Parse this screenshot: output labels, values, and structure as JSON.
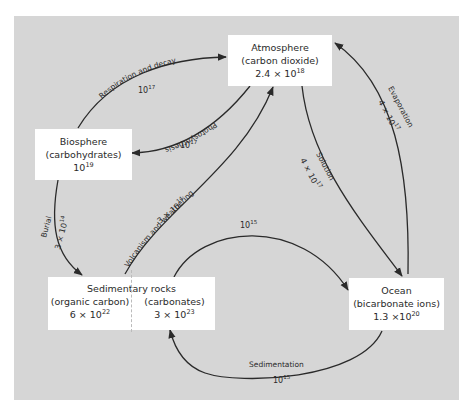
{
  "reservoirs": {
    "atmosphere": {
      "name": "Atmosphere",
      "sub": "(carbon dioxide)",
      "mantissa": "2.4 × 10",
      "exp": "18"
    },
    "biosphere": {
      "name": "Biosphere",
      "sub": "(carbohydrates)",
      "mantissa": "10",
      "exp": "19"
    },
    "sedimentary": {
      "name": "Sedimentary rocks",
      "organic": {
        "sub": "(organic carbon)",
        "mantissa": "6 × 10",
        "exp": "22"
      },
      "carbonates": {
        "sub": "(carbonates)",
        "mantissa": "3 × 10",
        "exp": "23"
      }
    },
    "ocean": {
      "name": "Ocean",
      "sub": "(bicarbonate ions)",
      "mantissa": "1.3 ×10",
      "exp": "20"
    }
  },
  "flows": [
    {
      "id": "respiration",
      "label": "Respiration and decay",
      "mantissa": "10",
      "exp": "17",
      "from": "biosphere",
      "to": "atmosphere"
    },
    {
      "id": "photosynthesis",
      "label": "Photosynthesis",
      "mantissa": "10",
      "exp": "17",
      "from": "atmosphere",
      "to": "biosphere"
    },
    {
      "id": "volcanism",
      "label": "Volcanism and weathering",
      "mantissa": "3 × 10",
      "exp": "14",
      "from": "sedimentary",
      "to": "atmosphere"
    },
    {
      "id": "burial",
      "label": "Burial",
      "mantissa": "3 × 10",
      "exp": "14",
      "from": "biosphere",
      "to": "sedimentary"
    },
    {
      "id": "solution",
      "label": "Solution",
      "mantissa": "4 × 10",
      "exp": "17",
      "from": "atmosphere",
      "to": "ocean"
    },
    {
      "id": "evaporation",
      "label": "Evaporation",
      "mantissa": "4 × 10",
      "exp": "17",
      "from": "ocean",
      "to": "atmosphere"
    },
    {
      "id": "dissolution",
      "label": "",
      "mantissa": "10",
      "exp": "15",
      "from": "sedimentary",
      "to": "ocean"
    },
    {
      "id": "sedimentation",
      "label": "Sedimentation",
      "mantissa": "10",
      "exp": "15",
      "from": "ocean",
      "to": "sedimentary"
    }
  ],
  "colors": {
    "panel": "#d6d6d6",
    "box": "#ffffff",
    "line": "#2a2a2a"
  }
}
